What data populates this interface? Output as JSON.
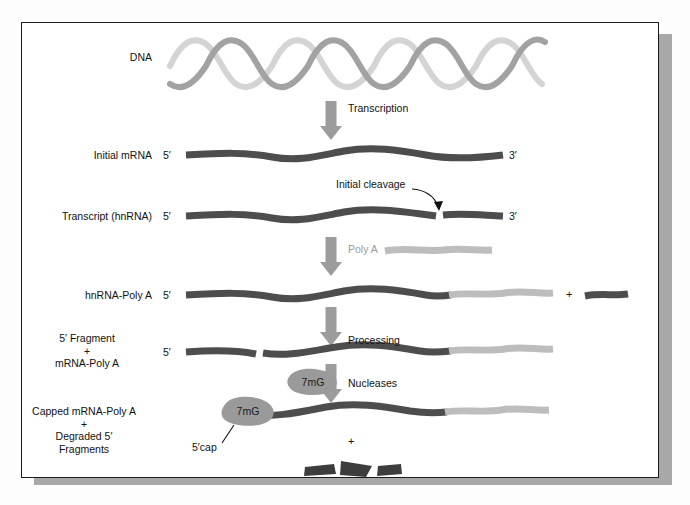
{
  "figure": {
    "background": "#ffffff",
    "frame_color": "#1a1a1a",
    "shadow_color": "#a8a8a8"
  },
  "colors": {
    "rna_dark": "#4d4d4d",
    "polya_light": "#b9b9b9",
    "dna_strand_a": "#9e9e9e",
    "dna_strand_b": "#d2d2d2",
    "arrow_gray": "#9c9c9c",
    "cap_blob": "#9a9a9a",
    "text": "#111111",
    "text_gray": "#9b9b9b"
  },
  "rows": [
    {
      "id": "dna",
      "label": "DNA",
      "five_prime": "",
      "three_prime": ""
    },
    {
      "id": "initial-mrna",
      "label": "Initial mRNA",
      "five_prime": "5′",
      "three_prime": "3′"
    },
    {
      "id": "transcript-hnrna",
      "label": "Transcript (hnRNA)",
      "five_prime": "5′",
      "three_prime": "3′"
    },
    {
      "id": "hnrna-polya",
      "label": "hnRNA-Poly A",
      "five_prime": "5′",
      "three_prime": ""
    },
    {
      "id": "fragment-mrna-polya",
      "label": "5′ Fragment\n+\nmRNA-Poly A",
      "five_prime": "5′",
      "three_prime": ""
    },
    {
      "id": "capped-mrna",
      "label": "Capped mRNA-Poly A\n+\nDegraded 5′\nFragments",
      "five_prime": "",
      "three_prime": ""
    }
  ],
  "arrows": [
    {
      "id": "transcription",
      "label": "Transcription",
      "label_color": "#111111"
    },
    {
      "id": "poly-a",
      "label": "Poly A",
      "label_color": "#9b9b9b"
    },
    {
      "id": "processing",
      "label": "Processing",
      "label_color": "#111111"
    },
    {
      "id": "nucleases",
      "label": "Nucleases",
      "label_color": "#111111"
    }
  ],
  "annotations": {
    "initial_cleavage": "Initial cleavage",
    "five_cap": "5′cap",
    "cap_tag": "7mG",
    "cap_tag_reagent": "7mG",
    "plus_hnrna_row": "+",
    "plus_bottom": "+"
  }
}
